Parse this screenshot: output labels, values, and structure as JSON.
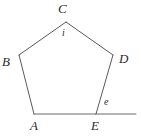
{
  "figure": {
    "name": "regular-pentagon-interior-exterior-angle-diagram",
    "colors": {
      "background": "#ffffff",
      "stroke": "#5a5a5a",
      "base_stroke": "#6b6b6b",
      "label": "#2b2b2b"
    },
    "stroke_width": 1,
    "vertices": [
      {
        "id": "A",
        "label": "A",
        "x": 34,
        "y": 114
      },
      {
        "id": "B",
        "label": "B",
        "x": 19,
        "y": 55
      },
      {
        "id": "C",
        "label": "C",
        "x": 66,
        "y": 22
      },
      {
        "id": "D",
        "label": "D",
        "x": 113,
        "y": 55
      },
      {
        "id": "E",
        "label": "E",
        "x": 96,
        "y": 114
      }
    ],
    "edges": [
      {
        "id": "AB",
        "from": "A",
        "to": "B"
      },
      {
        "id": "BC",
        "from": "B",
        "to": "C"
      },
      {
        "id": "CD",
        "from": "C",
        "to": "D"
      },
      {
        "id": "DE",
        "from": "D",
        "to": "E"
      },
      {
        "id": "EA",
        "from": "E",
        "to": "A"
      }
    ],
    "extension_ray": {
      "id": "E-extension",
      "from": "E",
      "to_x": 136,
      "to_y": 114
    },
    "angle_labels": [
      {
        "id": "i",
        "label": "i",
        "at_vertex": "C",
        "kind": "interior"
      },
      {
        "id": "e",
        "label": "e",
        "at_vertex": "E",
        "kind": "exterior"
      }
    ]
  }
}
